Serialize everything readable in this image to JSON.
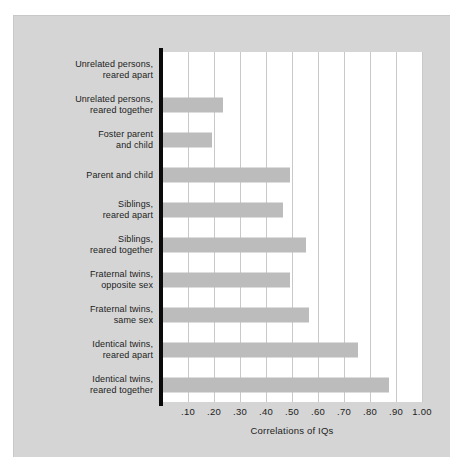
{
  "chart_data": {
    "type": "bar",
    "orientation": "horizontal",
    "title": "",
    "xlabel": "Correlations of IQs",
    "ylabel": "",
    "xlim": [
      0,
      1.0
    ],
    "xticks": [
      0.1,
      0.2,
      0.3,
      0.4,
      0.5,
      0.6,
      0.7,
      0.8,
      0.9,
      1.0
    ],
    "xtick_labels": [
      ".10",
      ".20",
      ".30",
      ".40",
      ".50",
      ".60",
      ".70",
      ".80",
      ".90",
      "1.00"
    ],
    "grid": true,
    "legend": false,
    "categories": [
      "Unrelated persons,\nreared apart",
      "Unrelated persons,\nreared together",
      "Foster parent\nand child",
      "Parent and child",
      "Siblings,\nreared apart",
      "Siblings,\nreared together",
      "Fraternal twins,\nopposite sex",
      "Fraternal twins,\nsame sex",
      "Identical twins,\nreared apart",
      "Identical twins,\nreared together"
    ],
    "values": [
      0.0,
      0.23,
      0.19,
      0.49,
      0.46,
      0.55,
      0.49,
      0.56,
      0.75,
      0.87
    ],
    "colors": {
      "bar": "#bcbcbc",
      "axis": "#0a0a0a",
      "gridline": "#c9c9c9",
      "plot_background": "#ffffff",
      "panel_background": "#d5d5d5",
      "text": "#1c1c1c"
    }
  }
}
